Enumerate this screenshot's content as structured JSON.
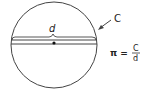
{
  "diagram": {
    "labels": {
      "diameter": "d",
      "circumference": "C",
      "formula_lhs": "π =",
      "formula_num": "C",
      "formula_den": "d"
    },
    "colors": {
      "stroke": "#333333",
      "background": "#ffffff"
    }
  }
}
